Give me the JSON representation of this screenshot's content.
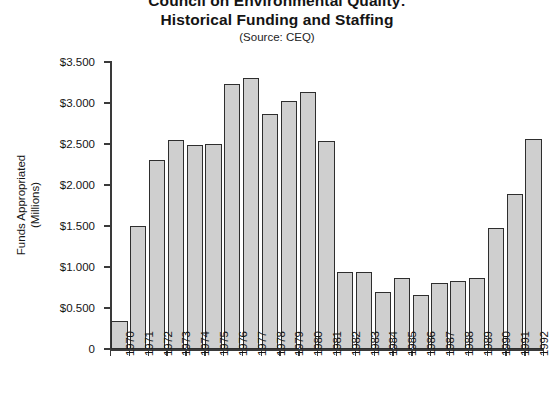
{
  "chart_data": {
    "type": "bar",
    "title": "Council on Environmental Quality:",
    "title_line2": "Historical Funding and Staffing",
    "subtitle": "(Source: CEQ)",
    "xlabel": "",
    "ylabel": "Funds Appropriated",
    "ylabel_line2": "(Millions)",
    "ylim": [
      0,
      3.5
    ],
    "grid": false,
    "legend": "none",
    "bar_fill_color": "#cfcfcf",
    "bar_border_color": "#2e2e2e",
    "ytick_labels": [
      "$3.500",
      "$3.000",
      "$2.500",
      "$2.000",
      "$1.500",
      "$1.000",
      "$0.500",
      "0"
    ],
    "ytick_values": [
      3.5,
      3.0,
      2.5,
      2.0,
      1.5,
      1.0,
      0.5,
      0
    ],
    "categories": [
      "1970",
      "1971",
      "1972",
      "1973",
      "1974",
      "1975",
      "1976",
      "1977",
      "1978",
      "1979",
      "1980",
      "1981",
      "1982",
      "1983",
      "1984",
      "1985",
      "1986",
      "1987",
      "1988",
      "1989",
      "1990",
      "1991",
      "1992"
    ],
    "values": [
      0.34,
      1.5,
      2.3,
      2.55,
      2.49,
      2.5,
      3.23,
      3.3,
      2.86,
      3.03,
      3.13,
      2.54,
      0.94,
      0.94,
      0.69,
      0.86,
      0.66,
      0.81,
      0.83,
      0.86,
      1.47,
      1.89,
      2.56
    ]
  }
}
